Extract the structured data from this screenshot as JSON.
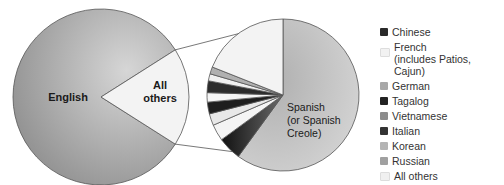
{
  "chart_data": {
    "type": "pie",
    "title": "",
    "main_pie": {
      "slices": [
        {
          "label": "English",
          "value": 82
        },
        {
          "label": "All others",
          "value": 18
        }
      ]
    },
    "detail_pie": {
      "slices": [
        {
          "label": "Spanish (or Spanish Creole)",
          "display": [
            "Spanish",
            "(or Spanish",
            "Creole)"
          ],
          "value": 60
        },
        {
          "label": "Chinese",
          "value": 5
        },
        {
          "label": "French (includes Patios, Cajun)",
          "value": 3.5
        },
        {
          "label": "German",
          "value": 2.5
        },
        {
          "label": "Tagalog",
          "value": 2.5
        },
        {
          "label": "Vietnamese",
          "value": 2
        },
        {
          "label": "Italian",
          "value": 2.5
        },
        {
          "label": "Korean",
          "value": 1.5
        },
        {
          "label": "Russian",
          "value": 1.5
        },
        {
          "label": "All others",
          "value": 19
        }
      ]
    },
    "main_labels": {
      "english": "English",
      "others_line1": "All",
      "others_line2": "others"
    },
    "legend": [
      {
        "label": "Chinese",
        "color": "#2a2a2a"
      },
      {
        "label": "French\n(includes Patios, Cajun)",
        "line1": "French",
        "line2": "(includes Patios, Cajun)",
        "color": "#f2f2f2"
      },
      {
        "label": "German",
        "color": "#a8a8a8"
      },
      {
        "label": "Tagalog",
        "color": "#222222"
      },
      {
        "label": "Vietnamese",
        "color": "#8c8c8c"
      },
      {
        "label": "Italian",
        "color": "#333333"
      },
      {
        "label": "Korean",
        "color": "#b4b4b4"
      },
      {
        "label": "Russian",
        "color": "#a0a0a0"
      },
      {
        "label": "All others",
        "color": "#f0f0f0"
      }
    ],
    "legend_position": "right"
  }
}
